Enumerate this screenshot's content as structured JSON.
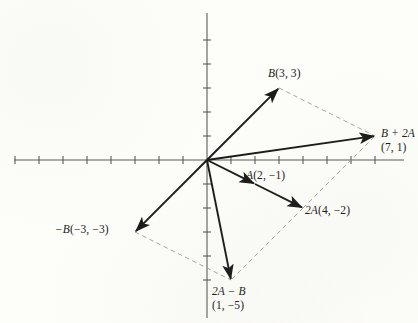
{
  "figure": {
    "background_color": "#fdfdf9",
    "ink_color": "#1b1b1b",
    "axis_color": "#555555",
    "dashed_color": "#9a9a9a"
  },
  "axes": {
    "origin_px": {
      "x": 207,
      "y": 160
    },
    "unit_px": 24,
    "x_axis": {
      "from_px": 14,
      "to_px": 404,
      "y_px": 160,
      "ticks_units": [
        -8,
        -7,
        -6,
        -5,
        -4,
        -3,
        -2,
        -1,
        1,
        2,
        3,
        4,
        5,
        6,
        7
      ]
    },
    "y_axis": {
      "from_px": 13,
      "to_px": 318,
      "x_px": 207,
      "ticks_units": [
        5,
        4,
        3,
        2,
        1,
        -1,
        -2,
        -3,
        -4,
        -5
      ]
    },
    "tick_half_length_px": 4
  },
  "chart_data": {
    "type": "scatter",
    "title": "",
    "xlabel": "",
    "ylabel": "",
    "xlim": [
      -8,
      8.2
    ],
    "ylim": [
      -6.6,
      6.2
    ],
    "grid": false,
    "legend": null,
    "vectors": [
      {
        "name": "B",
        "label": "B(3, 3)",
        "symbol": "B",
        "coords": [
          3,
          3
        ],
        "coords_text": "(3, 3)",
        "from": [
          0,
          0
        ],
        "to": [
          3,
          3
        ],
        "style": "solid-arrow"
      },
      {
        "name": "A",
        "label": "A(2, −1)",
        "symbol": "A",
        "coords": [
          2,
          -1
        ],
        "coords_text": "(2, −1)",
        "from": [
          0,
          0
        ],
        "to": [
          2,
          -1
        ],
        "style": "solid-arrow"
      },
      {
        "name": "2A",
        "label": "2A(4, −2)",
        "symbol": "2A",
        "coords": [
          4,
          -2
        ],
        "coords_text": "(4, −2)",
        "from": [
          2,
          -1
        ],
        "to": [
          4,
          -2
        ],
        "style": "solid-arrow"
      },
      {
        "name": "B + 2A",
        "label": "B + 2A",
        "symbol": "B + 2A",
        "coords": [
          7,
          1
        ],
        "coords_text": "(7, 1)",
        "from": [
          0,
          0
        ],
        "to": [
          7,
          1
        ],
        "style": "solid-arrow"
      },
      {
        "name": "-B",
        "label": "−B(−3, −3)",
        "symbol": "−B",
        "coords": [
          -3,
          -3
        ],
        "coords_text": "(−3, −3)",
        "from": [
          0,
          0
        ],
        "to": [
          -3,
          -3
        ],
        "style": "solid-arrow"
      },
      {
        "name": "2A - B",
        "label": "2A − B",
        "symbol": "2A − B",
        "coords": [
          1,
          -5
        ],
        "coords_text": "(1, −5)",
        "from": [
          0,
          0
        ],
        "to": [
          1,
          -5
        ],
        "style": "solid-arrow"
      }
    ],
    "dashed_segments": [
      {
        "name": "B-to-sum",
        "from": [
          3,
          3
        ],
        "to": [
          7,
          1
        ]
      },
      {
        "name": "2A-to-sum",
        "from": [
          4,
          -2
        ],
        "to": [
          7,
          1
        ]
      },
      {
        "name": "negB-to-diff",
        "from": [
          -3,
          -3
        ],
        "to": [
          1,
          -5
        ]
      },
      {
        "name": "2A-to-diff",
        "from": [
          4,
          -2
        ],
        "to": [
          1,
          -5
        ]
      }
    ]
  },
  "labels": {
    "b": {
      "text": "B(3, 3)",
      "symbol": "B",
      "coords_text": "(3, 3)",
      "x": 268,
      "y": 66
    },
    "sum": {
      "line1": "B + 2A",
      "line2": "(7, 1)",
      "x": 381,
      "y": 126
    },
    "a": {
      "text": "A(2, −1)",
      "symbol": "A",
      "coords_text": "(2, −1)",
      "x": 246,
      "y": 168
    },
    "two_a": {
      "text": "2A(4, −2)",
      "symbol": "2A",
      "coords_text": "(4, −2)",
      "x": 305,
      "y": 203
    },
    "neg_b": {
      "text": "−B(−3, −3)",
      "symbol": "−B",
      "coords_text": "(−3, −3)",
      "x": 55,
      "y": 222
    },
    "diff": {
      "line1": "2A − B",
      "line2": "(1, −5)",
      "x": 212,
      "y": 284
    }
  }
}
